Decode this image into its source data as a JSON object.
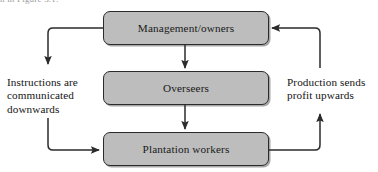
{
  "figure": {
    "cropped_caption_above": "n in Figure 3.1:",
    "type": "flow-diagram",
    "background_color": "#ffffff",
    "box_fill_color": "#bdbdbd",
    "box_border_color": "#2b2b2b",
    "text_color": "#141414",
    "arrow_color": "#2b2b2b"
  },
  "nodes": [
    {
      "id": "management",
      "label": "Management/owners",
      "x": 103,
      "y": 11,
      "width": 166,
      "height": 34
    },
    {
      "id": "overseers",
      "label": "Overseers",
      "x": 103,
      "y": 71,
      "width": 166,
      "height": 34
    },
    {
      "id": "workers",
      "label": "Plantation workers",
      "x": 103,
      "y": 132,
      "width": 166,
      "height": 34
    }
  ],
  "annotations": [
    {
      "id": "left-annotation",
      "side": "left",
      "lines": [
        "Instructions are",
        "communicated",
        "downwards"
      ],
      "text": "Instructions are communicated downwards"
    },
    {
      "id": "right-annotation",
      "side": "right",
      "lines": [
        "Production sends",
        "profit upwards"
      ],
      "text": "Production sends profit upwards"
    }
  ],
  "connectors": [
    {
      "id": "management-to-overseers",
      "from": "management",
      "to": "overseers",
      "direction": "down",
      "arrowhead": "end"
    },
    {
      "id": "overseers-to-workers",
      "from": "overseers",
      "to": "workers",
      "direction": "down",
      "arrowhead": "end"
    },
    {
      "id": "management-down-left",
      "from": "management",
      "to": "left-annotation",
      "direction": "left-then-down",
      "arrowhead": "end"
    },
    {
      "id": "left-down-to-workers",
      "from": "left-annotation",
      "to": "workers",
      "direction": "down-then-right",
      "arrowhead": "end"
    },
    {
      "id": "workers-up-right",
      "from": "workers",
      "to": "right-annotation",
      "direction": "right-then-up",
      "arrowhead": "end"
    },
    {
      "id": "right-up-to-management",
      "from": "right-annotation",
      "to": "management",
      "direction": "up-then-left",
      "arrowhead": "end"
    }
  ]
}
